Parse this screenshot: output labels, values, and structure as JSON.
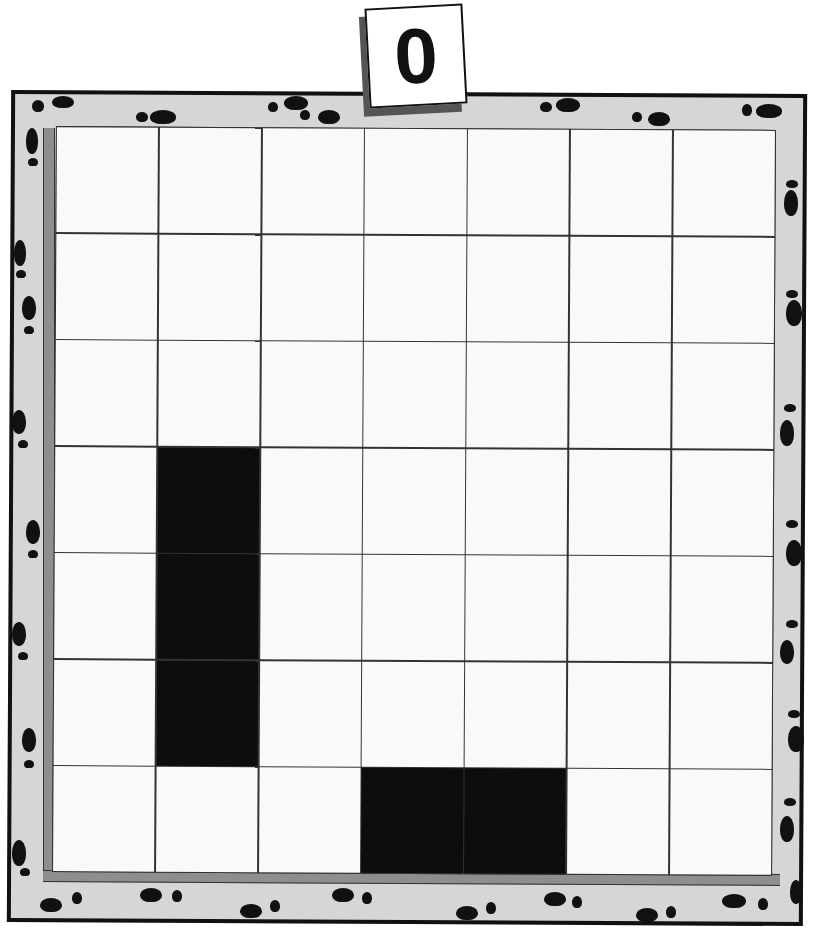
{
  "game": {
    "type": "grid-puzzle",
    "score_tile": "0",
    "grid": {
      "rows": 7,
      "cols": 7,
      "cells": [
        [
          0,
          0,
          0,
          0,
          0,
          0,
          0
        ],
        [
          0,
          0,
          0,
          0,
          0,
          0,
          0
        ],
        [
          0,
          0,
          0,
          0,
          0,
          0,
          0
        ],
        [
          0,
          1,
          0,
          0,
          0,
          0,
          0
        ],
        [
          0,
          1,
          0,
          0,
          0,
          0,
          0
        ],
        [
          0,
          1,
          0,
          0,
          0,
          0,
          0
        ],
        [
          0,
          0,
          0,
          1,
          1,
          0,
          0
        ]
      ]
    },
    "border_decoration": "footprints",
    "colors": {
      "frame": "#d6d6d6",
      "cell_empty": "#f9f9f9",
      "cell_filled": "#0d0d0d",
      "grid_line": "#333333",
      "bevel": "#8e8e8e"
    }
  }
}
